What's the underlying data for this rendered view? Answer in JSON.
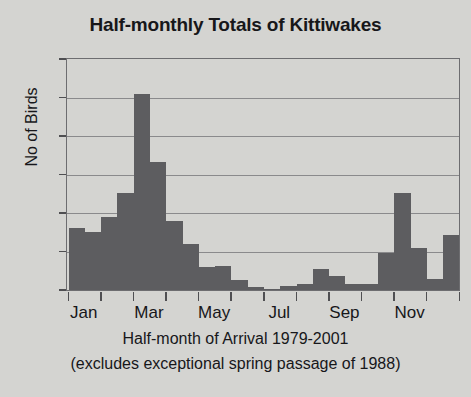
{
  "chart_data": {
    "type": "bar",
    "title": "Half-monthly Totals of Kittiwakes",
    "xlabel": "Half-month of Arrival 1979-2001",
    "xlabel_note": "(excludes exceptional spring passage of 1988)",
    "ylabel": "No of Birds",
    "ylim": [
      0,
      300
    ],
    "yticks": [
      0,
      50,
      100,
      150,
      200,
      250,
      300
    ],
    "ytick_labels": [
      "0",
      "50",
      "100",
      "150",
      "200",
      "250",
      "300"
    ],
    "grid": true,
    "legend": false,
    "bar_color": "#5d5d60",
    "plot_background": "#d4d4d1",
    "categories": [
      "Jan 1",
      "Jan 2",
      "Feb 1",
      "Feb 2",
      "Mar 1",
      "Mar 2",
      "Apr 1",
      "Apr 2",
      "May 1",
      "May 2",
      "Jun 1",
      "Jun 2",
      "Jul 1",
      "Jul 2",
      "Aug 1",
      "Aug 2",
      "Sep 1",
      "Sep 2",
      "Oct 1",
      "Oct 2",
      "Nov 1",
      "Nov 2",
      "Dec 1",
      "Dec 2"
    ],
    "values": [
      80,
      75,
      95,
      126,
      254,
      166,
      89,
      60,
      30,
      31,
      13,
      4,
      1,
      5,
      8,
      27,
      18,
      8,
      8,
      48,
      126,
      55,
      14,
      71
    ],
    "xtick_labels": [
      "Jan",
      "Mar",
      "May",
      "Jul",
      "Sep",
      "Nov"
    ],
    "xtick_positions": [
      0,
      4,
      8,
      12,
      16,
      20
    ]
  }
}
